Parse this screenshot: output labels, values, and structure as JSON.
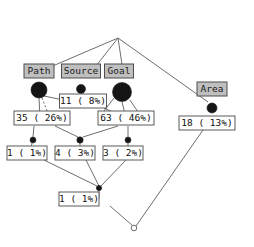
{
  "diagram": {
    "type": "decision-tree",
    "root": {
      "label": "Mass_theme",
      "x": 118,
      "y": 22,
      "w": 62,
      "h": 15
    },
    "attribute_nodes": [
      {
        "name": "path",
        "label": "Path",
        "x": 39,
        "y": 71,
        "w": 30,
        "h": 14,
        "dot": {
          "cx": 39,
          "cy": 90,
          "r": 8.0
        }
      },
      {
        "name": "source",
        "label": "Source",
        "x": 81,
        "y": 71,
        "w": 39,
        "h": 14,
        "dot": {
          "cx": 81,
          "cy": 89,
          "r": 4.5
        }
      },
      {
        "name": "goal",
        "label": "Goal",
        "x": 119,
        "y": 71,
        "w": 29,
        "h": 14,
        "dot": {
          "cx": 122,
          "cy": 92,
          "r": 9.5
        }
      },
      {
        "name": "area",
        "label": "Area",
        "x": 212,
        "y": 89,
        "w": 30,
        "h": 14,
        "dot": {
          "cx": 212,
          "cy": 108,
          "r": 5.0
        }
      }
    ],
    "count_nodes": [
      {
        "name": "count-11",
        "label": "11 ( 8%)",
        "x": 83,
        "y": 101,
        "w": 47,
        "h": 14
      },
      {
        "name": "count-35",
        "label": "35 ( 26%)",
        "x": 42,
        "y": 118,
        "w": 56,
        "h": 14
      },
      {
        "name": "count-63",
        "label": "63 ( 46%)",
        "x": 126,
        "y": 118,
        "w": 56,
        "h": 14
      },
      {
        "name": "count-18",
        "label": "18 ( 13%)",
        "x": 207,
        "y": 123,
        "w": 56,
        "h": 14
      },
      {
        "name": "count-1a",
        "label": "1 ( 1%)",
        "x": 27,
        "y": 153,
        "w": 40,
        "h": 14
      },
      {
        "name": "count-4",
        "label": "4 ( 3%)",
        "x": 75,
        "y": 153,
        "w": 40,
        "h": 14
      },
      {
        "name": "count-3",
        "label": "3 ( 2%)",
        "x": 123,
        "y": 153,
        "w": 40,
        "h": 14
      },
      {
        "name": "count-1b",
        "label": "1 ( 1%)",
        "x": 79,
        "y": 199,
        "w": 40,
        "h": 14
      }
    ],
    "junction_dots": [
      {
        "name": "junction-path",
        "cx": 33,
        "cy": 140,
        "r": 3.0,
        "style": "half"
      },
      {
        "name": "junction-source",
        "cx": 80,
        "cy": 140,
        "r": 3.2,
        "style": "half"
      },
      {
        "name": "junction-goal",
        "cx": 128,
        "cy": 140,
        "r": 3.0,
        "style": "half"
      },
      {
        "name": "junction-merge",
        "cx": 99,
        "cy": 188,
        "r": 2.6,
        "style": "filled"
      },
      {
        "name": "terminal-open",
        "cx": 134,
        "cy": 228,
        "r": 2.8,
        "style": "hollow"
      }
    ],
    "edges": [
      {
        "name": "root-to-path",
        "d": "M118,38 L41,71"
      },
      {
        "name": "root-to-source",
        "d": "M118,38 L92,71"
      },
      {
        "name": "root-to-goal",
        "d": "M118,38 L123,71"
      },
      {
        "name": "root-to-area",
        "d": "M118,38 L208,102"
      },
      {
        "name": "path-dot-to-35",
        "d": "M39,98 L40,118"
      },
      {
        "name": "path-dot-dashed",
        "d": "M42,98 L50,118",
        "dash": "2,2"
      },
      {
        "name": "path-dot-to-11",
        "d": "M44,96 L83,104"
      },
      {
        "name": "source-dot-to-11a",
        "d": "M78,94 L70,101"
      },
      {
        "name": "source-dot-to-11b",
        "d": "M84,94 L92,101"
      },
      {
        "name": "source-to-down",
        "d": "M81,94 L81,101"
      },
      {
        "name": "goal-dot-to-63",
        "d": "M122,102 L126,118"
      },
      {
        "name": "goal-dot-to-11",
        "d": "M114,98 L104,111"
      },
      {
        "name": "goal-dot-to-63b",
        "d": "M130,100 L142,118"
      },
      {
        "name": "b11-to-63",
        "d": "M104,108 L126,118"
      },
      {
        "name": "b35-to-junction-p",
        "d": "M34,126 L33,137"
      },
      {
        "name": "b35-to-junction-s",
        "d": "M55,126 L78,137"
      },
      {
        "name": "b63-to-junction-s",
        "d": "M118,126 L83,137"
      },
      {
        "name": "b63-to-junction-g",
        "d": "M128,126 L128,137"
      },
      {
        "name": "junction-p-to-1a",
        "d": "M32,143 L30,153"
      },
      {
        "name": "junction-s-to-4",
        "d": "M80,143 L80,153"
      },
      {
        "name": "junction-g-to-3",
        "d": "M128,143 L128,153"
      },
      {
        "name": "b1a-to-merge",
        "d": "M44,160 L97,186"
      },
      {
        "name": "b4-to-merge",
        "d": "M86,160 L99,186"
      },
      {
        "name": "b3-to-merge",
        "d": "M126,160 L101,186"
      },
      {
        "name": "merge-to-1b",
        "d": "M99,190 L99,199"
      },
      {
        "name": "b1b-to-terminal",
        "d": "M110,206 L133,226"
      },
      {
        "name": "b18-to-terminal",
        "d": "M203,130 L136,226"
      }
    ]
  }
}
